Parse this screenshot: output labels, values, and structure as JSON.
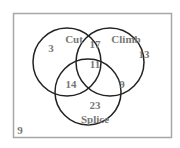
{
  "diagram": {
    "type": "venn3",
    "sets": [
      {
        "id": "cut",
        "label": "Cut"
      },
      {
        "id": "climb",
        "label": "Climb"
      },
      {
        "id": "splice",
        "label": "Splice"
      }
    ],
    "regions": {
      "cut_only": "3",
      "climb_only": "13",
      "splice_only": "23",
      "cut_climb": "17",
      "cut_splice": "14",
      "climb_splice": "9",
      "all_three": "11",
      "outside": "9"
    },
    "colors": {
      "border": "#a6a6a6",
      "circle_stroke": "#222222",
      "text": "#777777",
      "background": "#ffffff"
    }
  }
}
